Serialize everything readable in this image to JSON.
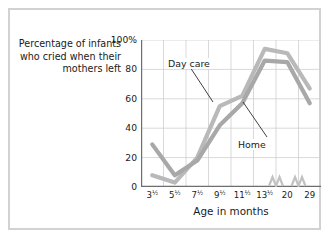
{
  "figure": {
    "border_color": "#d2d2d2",
    "background": "#ffffff"
  },
  "axis": {
    "y_caption": "Percentage of infants who cried when their mothers left",
    "x_caption": "Age in months",
    "y_ticks": [
      "0",
      "20",
      "40",
      "60",
      "80",
      "100%"
    ],
    "x_ticks": [
      {
        "whole": "3",
        "frac": "½"
      },
      {
        "whole": "5",
        "frac": "½"
      },
      {
        "whole": "7",
        "frac": "½"
      },
      {
        "whole": "9",
        "frac": "½"
      },
      {
        "whole": "11",
        "frac": "½"
      },
      {
        "whole": "13",
        "frac": "½"
      },
      {
        "whole": "20",
        "frac": ""
      },
      {
        "whole": "29",
        "frac": ""
      }
    ]
  },
  "annotations": {
    "day_care_label": "Day care",
    "home_label": "Home"
  },
  "chart_data": {
    "type": "line",
    "title": "",
    "xlabel": "Age in months",
    "ylabel": "Percentage of infants who cried when their mothers left",
    "categories": [
      "3½",
      "5½",
      "7½",
      "9½",
      "11½",
      "13½",
      "20",
      "29"
    ],
    "ylim": [
      0,
      100
    ],
    "yticks": [
      0,
      20,
      40,
      60,
      80,
      100
    ],
    "grid": true,
    "legend_position": "inline-annotation",
    "axis_breaks": [
      "before-20",
      "before-29"
    ],
    "series": [
      {
        "name": "Day care",
        "color": "#b9b9b9",
        "values": [
          8,
          3,
          20,
          55,
          62,
          94,
          91,
          67
        ]
      },
      {
        "name": "Home",
        "color": "#a8a8a8",
        "values": [
          29,
          8,
          18,
          42,
          57,
          86,
          85,
          57
        ]
      }
    ]
  }
}
